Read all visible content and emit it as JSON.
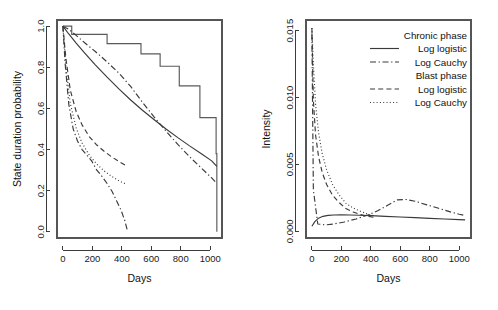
{
  "figure": {
    "background": "#ffffff",
    "line_color": "#3a3a3a",
    "axis_color": "#3c3c3c",
    "box_color": "#555555"
  },
  "chart_data": [
    {
      "id": "left",
      "type": "line",
      "title": "",
      "xlabel": "Days",
      "ylabel": "State duration probability",
      "xlim": [
        -40,
        1080
      ],
      "ylim": [
        -0.03,
        1.03
      ],
      "xticks": [
        0,
        200,
        400,
        600,
        800,
        1000
      ],
      "xtick_labels": [
        "0",
        "200",
        "400",
        "600",
        "800",
        "1000"
      ],
      "yticks": [
        0.0,
        0.2,
        0.4,
        0.6,
        0.8,
        1.0
      ],
      "ytick_labels": [
        "0.0",
        "0.2",
        "0.4",
        "0.6",
        "0.8",
        "1.0"
      ],
      "grid": false,
      "legend": "none",
      "series": [
        {
          "name": "Chronic phase empirical (Kaplan-Meier)",
          "style": "step",
          "dash": "none",
          "x": [
            0,
            30,
            60,
            170,
            300,
            430,
            530,
            660,
            790,
            870,
            930,
            1040,
            1045
          ],
          "y": [
            1.0,
            1.0,
            0.96,
            0.96,
            0.915,
            0.915,
            0.865,
            0.805,
            0.71,
            0.71,
            0.555,
            0.38,
            0.0
          ]
        },
        {
          "name": "Chronic phase Log logistic",
          "style": "curve",
          "dash": "none",
          "x": [
            0,
            40,
            90,
            150,
            220,
            300,
            380,
            460,
            540,
            620,
            700,
            780,
            860,
            940,
            1010,
            1045
          ],
          "y": [
            1.0,
            0.962,
            0.918,
            0.868,
            0.812,
            0.752,
            0.695,
            0.641,
            0.591,
            0.545,
            0.5,
            0.458,
            0.418,
            0.38,
            0.345,
            0.318
          ]
        },
        {
          "name": "Chronic phase Log Cauchy",
          "style": "curve",
          "dash": "dashdot",
          "x": [
            0,
            40,
            90,
            150,
            220,
            300,
            380,
            460,
            540,
            620,
            700,
            780,
            860,
            940,
            1010,
            1045
          ],
          "y": [
            1.0,
            0.985,
            0.955,
            0.918,
            0.877,
            0.826,
            0.772,
            0.707,
            0.63,
            0.558,
            0.49,
            0.425,
            0.365,
            0.31,
            0.262,
            0.235
          ]
        },
        {
          "name": "Blast phase Log logistic",
          "style": "curve",
          "dash": "dashed",
          "x": [
            0,
            20,
            50,
            90,
            130,
            180,
            230,
            280,
            330,
            380,
            430
          ],
          "y": [
            1.0,
            0.845,
            0.69,
            0.585,
            0.52,
            0.462,
            0.422,
            0.392,
            0.365,
            0.342,
            0.322
          ]
        },
        {
          "name": "Blast phase Log Cauchy",
          "style": "curve",
          "dash": "dotted",
          "x": [
            0,
            20,
            50,
            90,
            130,
            180,
            230,
            280,
            330,
            380,
            430
          ],
          "y": [
            1.0,
            0.81,
            0.625,
            0.505,
            0.432,
            0.372,
            0.33,
            0.296,
            0.27,
            0.248,
            0.232
          ]
        },
        {
          "name": "Blast phase empirical (Kaplan-Meier)",
          "style": "curve",
          "dash": "dashdot",
          "x": [
            0,
            15,
            40,
            70,
            100,
            130,
            160,
            195,
            230,
            265,
            300,
            335,
            365,
            395,
            420,
            440
          ],
          "y": [
            1.0,
            0.82,
            0.62,
            0.5,
            0.44,
            0.4,
            0.375,
            0.345,
            0.3,
            0.27,
            0.235,
            0.195,
            0.15,
            0.105,
            0.055,
            0.0
          ]
        }
      ]
    },
    {
      "id": "right",
      "type": "line",
      "title": "",
      "xlabel": "Days",
      "ylabel": "Intensity",
      "xlim": [
        -40,
        1080
      ],
      "ylim": [
        -0.0005,
        0.0158
      ],
      "xticks": [
        0,
        200,
        400,
        600,
        800,
        1000
      ],
      "xtick_labels": [
        "0",
        "200",
        "400",
        "600",
        "800",
        "1000"
      ],
      "yticks": [
        0.0,
        0.005,
        0.01,
        0.015
      ],
      "ytick_labels": [
        "0.000",
        "0.005",
        "0.010",
        "0.015"
      ],
      "grid": false,
      "legend": "top-right",
      "series": [
        {
          "name": "Chronic phase Log logistic",
          "style": "curve",
          "dash": "none",
          "x": [
            0,
            20,
            45,
            75,
            110,
            150,
            200,
            260,
            320,
            400,
            500,
            600,
            700,
            800,
            900,
            1000,
            1040
          ],
          "y": [
            0.00038,
            0.00072,
            0.00098,
            0.00112,
            0.00119,
            0.00122,
            0.00123,
            0.00122,
            0.0012,
            0.00117,
            0.00112,
            0.00107,
            0.00102,
            0.00097,
            0.00092,
            0.00087,
            0.00085
          ]
        },
        {
          "name": "Chronic phase Log Cauchy",
          "style": "curve",
          "dash": "dashdot",
          "x": [
            0,
            10,
            40,
            90,
            150,
            220,
            300,
            380,
            450,
            520,
            580,
            640,
            700,
            780,
            860,
            940,
            1000,
            1040
          ],
          "y": [
            0.0148,
            0.0031,
            0.00055,
            0.00048,
            0.00055,
            0.0007,
            0.00092,
            0.00122,
            0.00155,
            0.00198,
            0.00235,
            0.00238,
            0.00225,
            0.00198,
            0.00172,
            0.00145,
            0.00128,
            0.00118
          ]
        },
        {
          "name": "Blast phase Log logistic",
          "style": "curve",
          "dash": "dashed",
          "x": [
            0,
            10,
            25,
            45,
            70,
            100,
            140,
            180,
            230,
            280,
            330,
            380,
            420
          ],
          "y": [
            0.0152,
            0.0098,
            0.0072,
            0.0056,
            0.0044,
            0.0035,
            0.0027,
            0.0022,
            0.0017,
            0.00145,
            0.00125,
            0.00112,
            0.00105
          ]
        },
        {
          "name": "Blast phase Log Cauchy",
          "style": "curve",
          "dash": "dotted",
          "x": [
            0,
            10,
            25,
            45,
            70,
            100,
            140,
            180,
            230,
            280,
            330,
            380,
            420
          ],
          "y": [
            0.0152,
            0.0125,
            0.0095,
            0.0074,
            0.0058,
            0.0046,
            0.0035,
            0.0028,
            0.0021,
            0.00175,
            0.0015,
            0.00128,
            0.00118
          ]
        }
      ],
      "legend_entries": [
        {
          "label": "Chronic phase",
          "dash": "header"
        },
        {
          "label": "Log logistic",
          "dash": "none"
        },
        {
          "label": "Log Cauchy",
          "dash": "dashdot"
        },
        {
          "label": "Blast phase",
          "dash": "header"
        },
        {
          "label": "Log logistic",
          "dash": "dashed"
        },
        {
          "label": "Log Cauchy",
          "dash": "dotted"
        }
      ]
    }
  ]
}
